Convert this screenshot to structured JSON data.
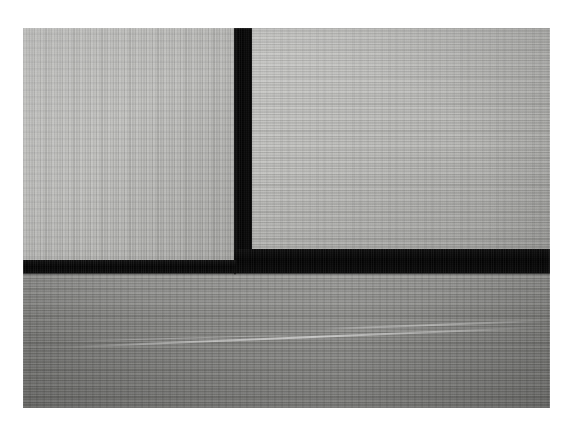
{
  "image": {
    "kind": "photograph",
    "subject": "tatami-mat-floor-junction",
    "caption": "Close-up photograph of tatami flooring: three straw mats meeting in a T-shaped junction, bordered by black cloth edging.",
    "orientation": "landscape",
    "canvas": {
      "width": 566,
      "height": 422
    },
    "border": {
      "color": "#ffffff",
      "left": 23,
      "top": 28,
      "right": 16,
      "bottom": 14
    },
    "print": {
      "left": 23,
      "top": 28,
      "width": 527,
      "height": 380
    }
  },
  "palette": {
    "paper_white": "#ffffff",
    "mat_light": "#b9b9b7",
    "mat_mid": "#b5b5b3",
    "mat_dark": "#8b8b89",
    "edging_black": "#0b0b0b",
    "highlight_white": "#ffffff"
  },
  "regions": [
    {
      "name": "upper-left-mat",
      "label": "Upper left tatami panel",
      "tone": "#b9b9b7",
      "weave_direction": "vertical",
      "brightness": "light",
      "bounds": {
        "x": 0,
        "y": 0,
        "width": 212,
        "height": 237
      }
    },
    {
      "name": "upper-right-mat",
      "label": "Upper right tatami panel",
      "tone": "#b5b5b3",
      "weave_direction": "horizontal",
      "brightness": "light",
      "bounds": {
        "x": 229,
        "y": 0,
        "width": 298,
        "height": 222
      }
    },
    {
      "name": "lower-mat",
      "label": "Lower tatami panel",
      "tone": "#8b8b89",
      "weave_direction": "horizontal",
      "brightness": "medium-dark",
      "bounds": {
        "x": 0,
        "y": 244,
        "width": 527,
        "height": 136
      }
    }
  ],
  "edging": {
    "label": "Black cloth mat edging (heri)",
    "color": "#0b0b0b",
    "junction": "T-shaped",
    "segments": [
      {
        "name": "vertical-edging",
        "label": "Vertical edging between upper mats",
        "orientation": "vertical",
        "bounds": {
          "x": 211,
          "y": 0,
          "width": 18,
          "height": 245
        }
      },
      {
        "name": "horizontal-edging-right",
        "label": "Right horizontal edging band",
        "orientation": "horizontal",
        "thickness": "thick",
        "bounds": {
          "x": 211,
          "y": 221,
          "width": 316,
          "height": 24
        }
      },
      {
        "name": "horizontal-edging-left",
        "label": "Left horizontal edging band",
        "orientation": "horizontal",
        "thickness": "thin",
        "bounds": {
          "x": 0,
          "y": 232,
          "width": 213,
          "height": 13
        }
      }
    ]
  },
  "highlights": [
    {
      "name": "scuff-main",
      "label": "Long pale fibre streak across lower mat",
      "angle_degrees": -2.35,
      "bounds": {
        "x": 46,
        "y": 318,
        "width": 470,
        "height": 2
      }
    },
    {
      "name": "scuff-second",
      "label": "Short secondary streak, left of centre",
      "angle_degrees": -1.6,
      "bounds": {
        "x": 40,
        "y": 313,
        "width": 260,
        "height": 1
      }
    },
    {
      "name": "scuff-third",
      "label": "Pale streak rising toward right edge",
      "angle_degrees": -2.1,
      "bounds": {
        "x": 300,
        "y": 300,
        "width": 225,
        "height": 2
      }
    }
  ]
}
